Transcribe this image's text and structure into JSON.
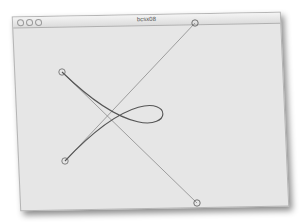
{
  "window": {
    "title": "bcsx08",
    "buttons": [
      "close",
      "minimize",
      "zoom"
    ]
  },
  "canvas": {
    "curve_color": "#555555",
    "guide_color": "#8a8a8a",
    "control_points": [
      {
        "name": "start",
        "x": 62,
        "y": 72
      },
      {
        "name": "end",
        "x": 65,
        "y": 161
      },
      {
        "name": "control-top",
        "x": 195,
        "y": 23
      },
      {
        "name": "control-bottom",
        "x": 197,
        "y": 203
      }
    ]
  }
}
